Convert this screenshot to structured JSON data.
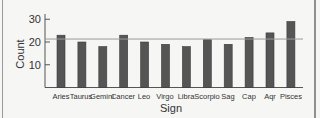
{
  "chart_data": {
    "type": "bar",
    "title": "",
    "xlabel": "Sign",
    "ylabel": "Count",
    "categories": [
      "Aries",
      "Taurus",
      "Gemini",
      "Cancer",
      "Leo",
      "Virgo",
      "Libra",
      "Scorpio",
      "Sag",
      "Cap",
      "Aqr",
      "Pisces"
    ],
    "values": [
      23,
      20,
      18,
      23,
      20,
      19,
      18,
      21,
      19,
      22,
      24,
      29
    ],
    "ylim": [
      0,
      32
    ],
    "yticks": [
      10,
      20,
      30
    ],
    "reference_line": {
      "value": 21.3,
      "label": ""
    },
    "grid": false,
    "legend": null,
    "colors": {
      "bar": "#555555",
      "bar_edge": "#3a3a3a",
      "axis": "#555555",
      "reference_line": "#9a9a9a"
    }
  },
  "labels": {
    "xlabel": "Sign",
    "ylabel": "Count",
    "yticks": [
      "10",
      "20",
      "30"
    ],
    "categories": [
      "Aries",
      "Taurus",
      "Gemini",
      "Cancer",
      "Leo",
      "Virgo",
      "Libra",
      "Scorpio",
      "Sag",
      "Cap",
      "Aqr",
      "Pisces"
    ]
  }
}
